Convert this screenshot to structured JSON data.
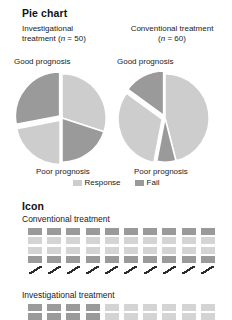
{
  "colors": {
    "response_light": "#cdcdcd",
    "fail_dark": "#9a9a9a",
    "icon_dark": "#9a9a9a",
    "icon_light": "#d4d4d4",
    "slash_stroke": "#2b2b2b",
    "text": "#1a1a1a",
    "background": "#ffffff"
  },
  "pie_section": {
    "title": "Pie chart",
    "columns": [
      {
        "name": "investigational",
        "line1": "Investigational",
        "line2_prefix": "treatment (",
        "line2_italic": "n",
        "line2_suffix": " = 50)",
        "good_label": "Good prognosis",
        "poor_label": "Poor prognosis"
      },
      {
        "name": "conventional",
        "line1": "Conventional treatment",
        "line2_prefix": "(",
        "line2_italic": "n",
        "line2_suffix": " = 60)",
        "good_label": "Good prognosis",
        "poor_label": "Poor prognosis"
      }
    ],
    "legend": [
      {
        "label": "Response",
        "color": "#cdcdcd"
      },
      {
        "label": "Fail",
        "color": "#9a9a9a"
      }
    ]
  },
  "icon_section": {
    "title": "Icon",
    "groups": [
      {
        "name": "conventional",
        "label": "Conventional treatment",
        "columns": 10,
        "rows": [
          "dark",
          "light",
          "light",
          "dark",
          "slash"
        ]
      },
      {
        "name": "investigational",
        "label": "Investigational treatment",
        "columns": 10,
        "rows": [
          "mixed-4dark",
          "mixed-4dark"
        ]
      }
    ]
  },
  "chart_data": {
    "type": "pie",
    "title": "Pie chart",
    "legend_position": "bottom-center",
    "legend": [
      "Response",
      "Fail"
    ],
    "charts": [
      {
        "name": "Investigational treatment",
        "n": 50,
        "top_label": "Good prognosis",
        "bottom_label": "Poor prognosis",
        "slices": [
          {
            "label": "Good prognosis - Response",
            "series": "Response",
            "value": 30,
            "color": "#cdcdcd",
            "exploded": false
          },
          {
            "label": "Good prognosis - Fail",
            "series": "Fail",
            "value": 20,
            "color": "#9a9a9a",
            "exploded": false
          },
          {
            "label": "Poor prognosis - Response",
            "series": "Response",
            "value": 22,
            "color": "#cdcdcd",
            "exploded": true
          },
          {
            "label": "Poor prognosis - Fail",
            "series": "Fail",
            "value": 28,
            "color": "#9a9a9a",
            "exploded": true
          }
        ]
      },
      {
        "name": "Conventional treatment",
        "n": 60,
        "top_label": "Good prognosis",
        "bottom_label": "Poor prognosis",
        "slices": [
          {
            "label": "Good prognosis - Response",
            "series": "Response",
            "value": 46,
            "color": "#cdcdcd",
            "exploded": false
          },
          {
            "label": "Good prognosis - Fail",
            "series": "Fail",
            "value": 7,
            "color": "#9a9a9a",
            "exploded": false
          },
          {
            "label": "Poor prognosis - Response",
            "series": "Response",
            "value": 32,
            "color": "#cdcdcd",
            "exploded": true
          },
          {
            "label": "Poor prognosis - Fail",
            "series": "Fail",
            "value": 15,
            "color": "#9a9a9a",
            "exploded": true
          }
        ]
      }
    ]
  }
}
